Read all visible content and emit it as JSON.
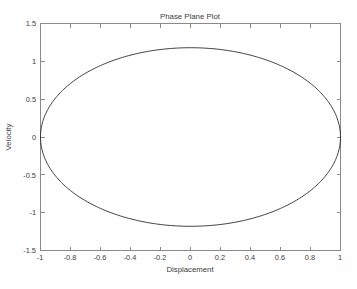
{
  "chart_data": {
    "type": "line",
    "title": "Phase Plane Plot",
    "xlabel": "Displacement",
    "ylabel": "Velocity",
    "xlim": [
      -1,
      1
    ],
    "ylim": [
      -1.5,
      1.5
    ],
    "grid": false,
    "legend": null,
    "xticks": [
      -1,
      -0.8,
      -0.6,
      -0.4,
      -0.2,
      0,
      0.2,
      0.4,
      0.6,
      0.8,
      1
    ],
    "xticklabels": [
      "-1",
      "-0.8",
      "-0.6",
      "-0.4",
      "-0.2",
      "0",
      "0.2",
      "0.4",
      "0.6",
      "0.8",
      "1"
    ],
    "yticks": [
      -1.5,
      -1,
      -0.5,
      0,
      0.5,
      1,
      1.5
    ],
    "yticklabels": [
      "-1.5",
      "-1",
      "-0.5",
      "0",
      "0.5",
      "1",
      "1.5"
    ],
    "line_color": "#2a2a2a",
    "axis_color": "#8a8a8a",
    "background_color": "#ffffff",
    "series": [
      {
        "name": "orbit",
        "description": "closed elliptical phase-plane trajectory of an undamped oscillator",
        "closed": true,
        "x_amplitude": 1.0,
        "y_amplitude": 1.18,
        "center": [
          0,
          0
        ],
        "x": [
          1.0,
          0.995,
          0.98,
          0.956,
          0.921,
          0.876,
          0.823,
          0.76,
          0.691,
          0.614,
          0.53,
          0.442,
          0.35,
          0.253,
          0.156,
          0.057,
          -0.043,
          -0.141,
          -0.239,
          -0.333,
          -0.425,
          -0.512,
          -0.595,
          -0.672,
          -0.743,
          -0.807,
          -0.863,
          -0.911,
          -0.95,
          -0.979,
          -0.997,
          -1.0,
          -0.996,
          -0.982,
          -0.959,
          -0.926,
          -0.884,
          -0.833,
          -0.773,
          -0.705,
          -0.63,
          -0.548,
          -0.46,
          -0.368,
          -0.273,
          -0.175,
          -0.076,
          0.024,
          0.123,
          0.221,
          0.316,
          0.409,
          0.497,
          0.581,
          0.66,
          0.733,
          0.799,
          0.857,
          0.906,
          0.947,
          0.978,
          0.995,
          1.0
        ],
        "y": [
          0.0,
          0.118,
          0.235,
          0.349,
          0.459,
          0.566,
          0.667,
          0.762,
          0.85,
          0.931,
          1.003,
          1.065,
          1.118,
          1.16,
          1.191,
          1.18,
          1.178,
          1.171,
          1.152,
          1.122,
          1.08,
          1.029,
          0.967,
          0.895,
          0.813,
          0.724,
          0.627,
          0.524,
          0.415,
          0.302,
          0.187,
          0.069,
          -0.049,
          -0.167,
          -0.283,
          -0.396,
          -0.505,
          -0.609,
          -0.707,
          -0.798,
          -0.881,
          -0.956,
          -1.02,
          -1.075,
          -1.119,
          -1.152,
          -1.173,
          -1.182,
          -1.178,
          -1.162,
          -1.135,
          -1.096,
          -1.046,
          -0.985,
          -0.914,
          -0.834,
          -0.745,
          -0.649,
          -0.547,
          -0.439,
          -0.328,
          -0.213,
          -0.097
        ]
      }
    ]
  },
  "figure": {
    "title": "Phase Plane Plot",
    "x_axis_label": "Displacement",
    "y_axis_label": "Velocity"
  }
}
